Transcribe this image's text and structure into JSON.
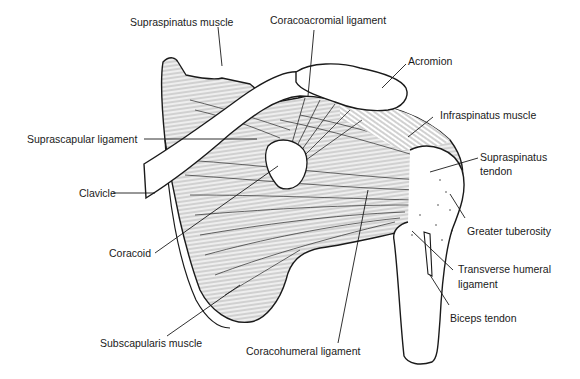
{
  "figure": {
    "labels": {
      "supraspinatus_muscle": "Supraspinatus muscle",
      "coracoacromial_ligament": "Coracoacromial ligament",
      "acromion": "Acromion",
      "infraspinatus_muscle": "Infraspinatus muscle",
      "suprascapular_ligament": "Suprascapular ligament",
      "supraspinatus_tendon_line1": "Supraspinatus",
      "supraspinatus_tendon_line2": "tendon",
      "clavicle": "Clavicle",
      "greater_tuberosity": "Greater tuberosity",
      "coracoid": "Coracoid",
      "transverse_humeral_ligament_line1": "Transverse humeral",
      "transverse_humeral_ligament_line2": "ligament",
      "biceps_tendon": "Biceps tendon",
      "subscapularis_muscle": "Subscapularis muscle",
      "coracohumeral_ligament": "Coracohumeral ligament"
    },
    "colors": {
      "ink": "#1a1a1a",
      "background": "#ffffff",
      "shade": "#d9d9d9"
    }
  }
}
